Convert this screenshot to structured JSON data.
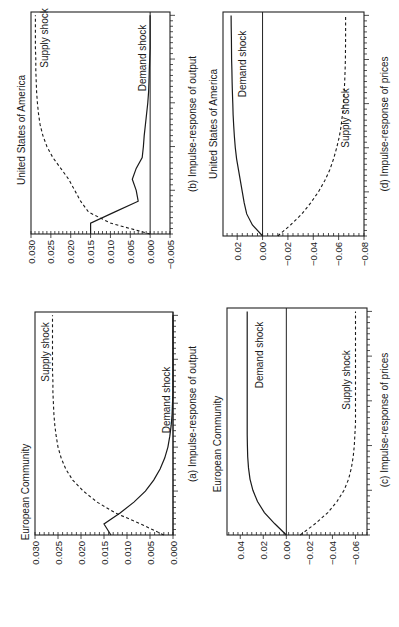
{
  "figure": {
    "orientation": "rotated-90-ccw",
    "panels": [
      {
        "id": "b",
        "title": "United States of America",
        "caption": "(b) Impulse-response of output",
        "frame": {
          "left": 31,
          "right": 170,
          "top": 12,
          "bottom": 234
        },
        "value_range": [
          0.03,
          -0.005
        ],
        "ticks": [
          "0.030",
          "0.025",
          "0.020",
          "0.015",
          "0.010",
          "0.005",
          "0.000",
          "-0.005"
        ],
        "tick_values": [
          0.03,
          0.025,
          0.02,
          0.015,
          0.01,
          0.005,
          0.0,
          -0.005
        ],
        "demand_label": "Demand shock",
        "supply_label": "Supply shock"
      },
      {
        "id": "a",
        "title": "European Community",
        "caption": "(a) Impulse-response of output",
        "frame": {
          "left": 35,
          "right": 173,
          "top": 312,
          "bottom": 535
        },
        "value_range": [
          0.03,
          0.0
        ],
        "ticks": [
          "0.030",
          "0.025",
          "0.020",
          "0.015",
          "0.010",
          "0.005",
          "0.000"
        ],
        "tick_values": [
          0.03,
          0.025,
          0.02,
          0.015,
          0.01,
          0.005,
          0.0
        ],
        "demand_label": "Demand shock",
        "supply_label": "Supply shock"
      },
      {
        "id": "d",
        "title": "United States of America",
        "caption": "(d) Impulse-response of prices",
        "frame": {
          "left": 223,
          "right": 364,
          "top": 12,
          "bottom": 236
        },
        "value_range": [
          0.0312,
          -0.08
        ],
        "ticks": [
          "0.02",
          "0.00",
          "-0.02",
          "-0.04",
          "-0.06",
          "-0.08"
        ],
        "tick_values": [
          0.02,
          0.0,
          -0.02,
          -0.04,
          -0.06,
          -0.08
        ],
        "demand_label": "Demand shock",
        "supply_label": "Supply shock"
      },
      {
        "id": "c",
        "title": "European Community",
        "caption": "(c) Impulse-response of prices",
        "frame": {
          "left": 227,
          "right": 367,
          "top": 308,
          "bottom": 535
        },
        "value_range": [
          0.0515,
          -0.07
        ],
        "ticks": [
          "0.04",
          "0.02",
          "0.00",
          "-0.02",
          "-0.04",
          "-0.06"
        ],
        "tick_values": [
          0.04,
          0.02,
          0.0,
          -0.02,
          -0.04,
          -0.06
        ],
        "demand_label": "Demand shock",
        "supply_label": "Supply shock"
      }
    ]
  },
  "chart_data": [
    {
      "type": "line",
      "panel": "(a)",
      "title": "European Community",
      "caption": "(a) Impulse-response of output",
      "xlabel": "Periods after shock",
      "ylabel": "Impulse response of output",
      "ylim": [
        0.0,
        0.03
      ],
      "x": [
        0,
        1,
        2,
        3,
        4,
        5,
        6,
        7,
        8,
        9,
        10,
        11,
        12,
        13,
        14,
        15,
        16,
        17,
        18,
        19,
        20
      ],
      "series": [
        {
          "name": "Demand shock",
          "style": "solid",
          "values": [
            0.0135,
            0.015,
            0.0115,
            0.0085,
            0.006,
            0.0042,
            0.0028,
            0.0018,
            0.0011,
            0.0007,
            0.0004,
            0.0002,
            0.0001,
            0.0,
            0.0,
            0.0,
            0.0,
            0.0,
            0.0,
            0.0,
            0.0
          ]
        },
        {
          "name": "Supply shock",
          "style": "dashed",
          "values": [
            0.002,
            0.007,
            0.0125,
            0.0165,
            0.0195,
            0.0218,
            0.0233,
            0.0243,
            0.025,
            0.0254,
            0.0257,
            0.0259,
            0.026,
            0.0261,
            0.0261,
            0.0262,
            0.0262,
            0.0262,
            0.0262,
            0.0262,
            0.0262
          ]
        }
      ]
    },
    {
      "type": "line",
      "panel": "(b)",
      "title": "United States of America",
      "caption": "(b) Impulse-response of output",
      "xlabel": "Periods after shock",
      "ylabel": "Impulse response of output",
      "ylim": [
        -0.005,
        0.03
      ],
      "x": [
        0,
        1,
        2,
        3,
        4,
        5,
        6,
        7,
        8,
        9,
        10,
        11,
        12,
        13,
        14,
        15,
        16,
        17,
        18,
        19,
        20
      ],
      "series": [
        {
          "name": "Demand shock",
          "style": "solid",
          "values": [
            0.015,
            0.015,
            0.009,
            0.003,
            0.0035,
            0.0045,
            0.0035,
            0.002,
            0.0017,
            0.0015,
            0.0012,
            0.0009,
            0.0006,
            0.0004,
            0.0003,
            0.0002,
            0.0001,
            0.0,
            0.0,
            0.0,
            0.0
          ]
        },
        {
          "name": "Supply shock",
          "style": "dashed",
          "values": [
            0.0,
            0.01,
            0.0155,
            0.0175,
            0.019,
            0.0205,
            0.0225,
            0.0245,
            0.026,
            0.027,
            0.0277,
            0.0281,
            0.0284,
            0.0286,
            0.0287,
            0.0288,
            0.0288,
            0.0289,
            0.0289,
            0.0289,
            0.0289
          ]
        }
      ]
    },
    {
      "type": "line",
      "panel": "(c)",
      "title": "European Community",
      "caption": "(c) Impulse-response of prices",
      "xlabel": "Periods after shock",
      "ylabel": "Impulse response of prices",
      "ylim": [
        -0.07,
        0.05
      ],
      "x": [
        0,
        1,
        2,
        3,
        4,
        5,
        6,
        7,
        8,
        9,
        10,
        11,
        12,
        13,
        14,
        15,
        16,
        17,
        18,
        19,
        20
      ],
      "series": [
        {
          "name": "Demand shock",
          "style": "solid",
          "values": [
            0.0,
            0.01,
            0.019,
            0.025,
            0.029,
            0.0315,
            0.0328,
            0.0335,
            0.0338,
            0.034,
            0.034,
            0.034,
            0.034,
            0.034,
            0.034,
            0.034,
            0.034,
            0.034,
            0.034,
            0.034,
            0.034
          ]
        },
        {
          "name": "Supply shock",
          "style": "dashed",
          "values": [
            -0.012,
            -0.025,
            -0.036,
            -0.044,
            -0.05,
            -0.054,
            -0.0565,
            -0.058,
            -0.059,
            -0.0595,
            -0.06,
            -0.06,
            -0.06,
            -0.06,
            -0.06,
            -0.06,
            -0.06,
            -0.06,
            -0.06,
            -0.06,
            -0.06
          ]
        }
      ]
    },
    {
      "type": "line",
      "panel": "(d)",
      "title": "United States of America",
      "caption": "(d) Impulse-response of prices",
      "xlabel": "Periods after shock",
      "ylabel": "Impulse response of prices",
      "ylim": [
        -0.08,
        0.03
      ],
      "x": [
        0,
        1,
        2,
        3,
        4,
        5,
        6,
        7,
        8,
        9,
        10,
        11,
        12,
        13,
        14,
        15,
        16,
        17,
        18,
        19,
        20
      ],
      "series": [
        {
          "name": "Demand shock",
          "style": "solid",
          "values": [
            0.0,
            0.008,
            0.0125,
            0.0145,
            0.016,
            0.0175,
            0.019,
            0.0205,
            0.0215,
            0.0222,
            0.0228,
            0.0232,
            0.0235,
            0.0238,
            0.024,
            0.0242,
            0.0244,
            0.0245,
            0.0246,
            0.0247,
            0.0248
          ]
        },
        {
          "name": "Supply shock",
          "style": "dashed",
          "values": [
            -0.012,
            -0.022,
            -0.031,
            -0.038,
            -0.044,
            -0.049,
            -0.053,
            -0.056,
            -0.0585,
            -0.0605,
            -0.062,
            -0.063,
            -0.0638,
            -0.0644,
            -0.0648,
            -0.0651,
            -0.0653,
            -0.0654,
            -0.0655,
            -0.0655,
            -0.0655
          ]
        }
      ]
    }
  ]
}
